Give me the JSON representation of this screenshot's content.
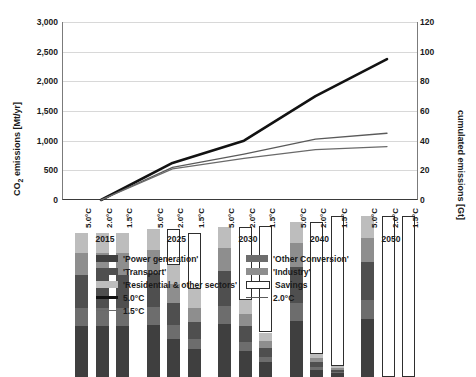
{
  "chart_data": {
    "type": "bar",
    "title": "",
    "ylabel_left": "CO₂ emissions [Mt/yr]",
    "ylabel_right": "cumulated emissions [Gt]",
    "xlabel": "",
    "ylim_left": [
      0,
      3000
    ],
    "ylim_right": [
      0,
      120
    ],
    "ytick_left": [
      "0",
      "500",
      "1,000",
      "1,500",
      "2,000",
      "2,500",
      "3,000"
    ],
    "ytick_right": [
      "0",
      "20",
      "40",
      "60",
      "80",
      "100",
      "120"
    ],
    "grid": true,
    "legend_position": "bottom",
    "years": [
      "2015",
      "2025",
      "2030",
      "2040",
      "2050"
    ],
    "scenarios": [
      "5.0°C",
      "2.0°C",
      "1.5°C"
    ],
    "stack_order": [
      "Power generation",
      "Other Conversion",
      "Transport",
      "Industry",
      "Residential & other sectors",
      "Savings"
    ],
    "series": [
      {
        "name": "'Power generation'",
        "color": "#3f3f3f",
        "values": [
          [
            860,
            860,
            860
          ],
          [
            880,
            640,
            470
          ],
          [
            900,
            430,
            250
          ],
          [
            940,
            120,
            60
          ],
          [
            980,
            0,
            0
          ]
        ]
      },
      {
        "name": "'Other Conversion'",
        "color": "#6d6d6d",
        "values": [
          [
            300,
            300,
            300
          ],
          [
            300,
            230,
            170
          ],
          [
            300,
            160,
            90
          ],
          [
            310,
            45,
            20
          ],
          [
            320,
            0,
            0
          ]
        ]
      },
      {
        "name": "'Transport'",
        "color": "#4f4f4f",
        "values": [
          [
            560,
            560,
            560
          ],
          [
            580,
            380,
            290
          ],
          [
            590,
            270,
            150
          ],
          [
            610,
            80,
            35
          ],
          [
            630,
            0,
            0
          ]
        ]
      },
      {
        "name": "'Industry'",
        "color": "#8e8e8e",
        "values": [
          [
            370,
            370,
            370
          ],
          [
            380,
            310,
            240
          ],
          [
            390,
            210,
            120
          ],
          [
            400,
            70,
            30
          ],
          [
            410,
            0,
            0
          ]
        ]
      },
      {
        "name": "'Residential & other sectors'",
        "color": "#bdbdbd",
        "values": [
          [
            340,
            340,
            340
          ],
          [
            350,
            330,
            310
          ],
          [
            350,
            230,
            140
          ],
          [
            360,
            65,
            35
          ],
          [
            370,
            0,
            0
          ]
        ]
      },
      {
        "name": "Savings",
        "color": "#ffffff",
        "values": [
          [
            0,
            0,
            0
          ],
          [
            0,
            600,
            950
          ],
          [
            0,
            1230,
            1800
          ],
          [
            0,
            2240,
            2530
          ],
          [
            0,
            2710,
            2710
          ]
        ]
      }
    ],
    "bar_totals_emissions": [
      [
        2430,
        2430,
        2430
      ],
      [
        2490,
        1890,
        1480
      ],
      [
        2530,
        1300,
        750
      ],
      [
        2620,
        380,
        180
      ],
      [
        2710,
        0,
        0
      ]
    ],
    "bar_totals_with_savings": [
      [
        2430,
        2430,
        2430
      ],
      [
        2490,
        2490,
        2430
      ],
      [
        2530,
        2530,
        2550
      ],
      [
        2620,
        2620,
        2710
      ],
      [
        2710,
        2710,
        2710
      ]
    ],
    "lines": [
      {
        "name": "5.0°C",
        "color": "#121212",
        "width": 2.6,
        "x": [
          "2015",
          "2025",
          "2030",
          "2040",
          "2050"
        ],
        "values_gt": [
          0,
          25,
          40,
          70,
          95
        ]
      },
      {
        "name": "2.0°C",
        "color": "#5a5a5a",
        "width": 1.3,
        "x": [
          "2015",
          "2025",
          "2030",
          "2040",
          "2050"
        ],
        "values_gt": [
          0,
          22,
          31,
          41,
          45
        ]
      },
      {
        "name": "1.5°C",
        "color": "#6a6a6a",
        "width": 1.3,
        "x": [
          "2015",
          "2025",
          "2030",
          "2040",
          "2050"
        ],
        "values_gt": [
          0,
          21,
          28,
          34,
          36
        ]
      }
    ]
  },
  "axes": {
    "left_title": "CO₂ emissions [Mt/yr]",
    "left_title_pre": "CO",
    "left_title_sub": "2",
    "left_title_post": " emissions [Mt/yr]",
    "right_title": "cumulated emissions [Gt]",
    "yticks_left": [
      "3,000",
      "2,500",
      "2,000",
      "1,500",
      "1,000",
      "500",
      "0"
    ],
    "yticks_right": [
      "120",
      "100",
      "80",
      "60",
      "40",
      "20",
      "0"
    ]
  },
  "xaxis": {
    "groups": [
      {
        "year": "2015",
        "scenarios": [
          "5.0°C",
          "2.0°C",
          "1.5°C"
        ]
      },
      {
        "year": "2025",
        "scenarios": [
          "5.0°C",
          "2.0°C",
          "1.5°C"
        ]
      },
      {
        "year": "2030",
        "scenarios": [
          "5.0°C",
          "2.0°C",
          "1.5°C"
        ]
      },
      {
        "year": "2040",
        "scenarios": [
          "5.0°C",
          "2.0°C",
          "1.5°C"
        ]
      },
      {
        "year": "2050",
        "scenarios": [
          "5.0°C",
          "2.0°C",
          "1.5°C"
        ]
      }
    ]
  },
  "legend": {
    "items": [
      {
        "label": "'Power generation'",
        "type": "swatch",
        "color": "#3f3f3f"
      },
      {
        "label": "'Other Conversion'",
        "type": "swatch",
        "color": "#6d6d6d"
      },
      {
        "label": "'Transport'",
        "type": "swatch",
        "color": "#4f4f4f"
      },
      {
        "label": "'Industry'",
        "type": "swatch",
        "color": "#8e8e8e"
      },
      {
        "label": "'Residential & other sectors'",
        "type": "swatch",
        "color": "#bdbdbd"
      },
      {
        "label": "Savings",
        "type": "box",
        "color": "#ffffff"
      },
      {
        "label": "5.0°C",
        "type": "line",
        "color": "#121212"
      },
      {
        "label": "2.0°C",
        "type": "line",
        "color": "#5a5a5a"
      },
      {
        "label": "1.5°C",
        "type": "line",
        "color": "#6a6a6a"
      }
    ]
  }
}
